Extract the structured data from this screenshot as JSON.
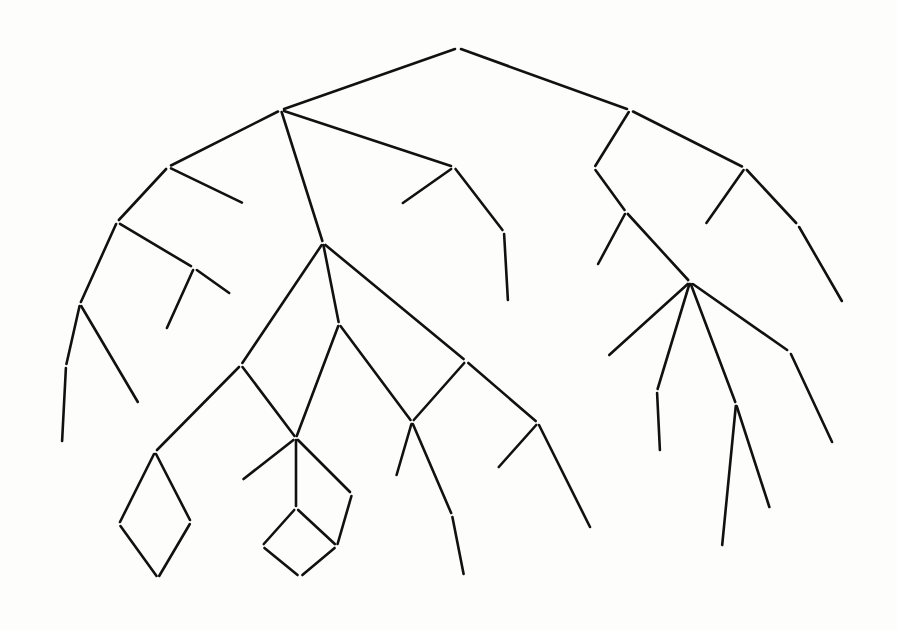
{
  "diagram": {
    "kind": "ontology-hierarchy",
    "ink_color": "#111111",
    "background_color": "#fdfdfc",
    "width": 897,
    "height": 630
  },
  "nodes": [
    {
      "id": "T",
      "label": "T",
      "x": 458,
      "y": 48,
      "root": true
    },
    {
      "id": "ENTITY",
      "label": "ENTITY",
      "x": 281,
      "y": 110
    },
    {
      "id": "SITUATION",
      "label": "SITUATION",
      "x": 630,
      "y": 110
    },
    {
      "id": "REPRESENTATION",
      "label": "REPRESENTATION",
      "x": 168,
      "y": 167
    },
    {
      "id": "ABSTRACTION",
      "label": "ABSTRACTION",
      "x": 454,
      "y": 167
    },
    {
      "id": "PROCESS",
      "label": "PROCESS",
      "x": 594,
      "y": 168
    },
    {
      "id": "STATE",
      "label": "STATE",
      "x": 745,
      "y": 168
    },
    {
      "id": "IMAGE",
      "label": "IMAGE",
      "x": 245,
      "y": 204
    },
    {
      "id": "JUSTICE",
      "label": "JUSTICE",
      "x": 400,
      "y": 205
    },
    {
      "id": "LEXICAL-DATA",
      "label": "LEXICAL-DATA",
      "x": 117,
      "y": 222
    },
    {
      "id": "EVENT",
      "label": "EVENT",
      "x": 626,
      "y": 212
    },
    {
      "id": "OWN",
      "label": "OWN",
      "x": 705,
      "y": 225
    },
    {
      "id": "BELIEVE",
      "label": "BELIEVE",
      "x": 798,
      "y": 225
    },
    {
      "id": "PROPOSITION",
      "label": "PROPOSITION",
      "x": 504,
      "y": 232
    },
    {
      "id": "PHYS-OBJECT",
      "label": "PHYS-OBJECT",
      "x": 323,
      "y": 243
    },
    {
      "id": "STRUCTURE",
      "label": "STRUCTURE",
      "x": 194,
      "y": 268
    },
    {
      "id": "STORM",
      "label": "STORM",
      "x": 597,
      "y": 266
    },
    {
      "id": "LIST",
      "label": "LIST",
      "x": 232,
      "y": 295
    },
    {
      "id": "ATOM",
      "label": "ATOM",
      "x": 80,
      "y": 304
    },
    {
      "id": "HYPOTHESIS",
      "label": "HYPOTHESIS",
      "x": 508,
      "y": 302
    },
    {
      "id": "KNOW",
      "label": "KNOW",
      "x": 843,
      "y": 303
    },
    {
      "id": "ACTION",
      "label": "ACTION",
      "x": 690,
      "y": 282
    },
    {
      "id": "MOBILE-ENTITY",
      "label": "MOBILE-ENTITY",
      "x": 339,
      "y": 324
    },
    {
      "id": "ARRAY",
      "label": "ARRAY",
      "x": 166,
      "y": 330
    },
    {
      "id": "NUMBER",
      "label": "NUMBER",
      "x": 66,
      "y": 366
    },
    {
      "id": "LIVING",
      "label": "LIVING",
      "x": 241,
      "y": 365
    },
    {
      "id": "NONLIVING",
      "label": "NONLIVING",
      "x": 466,
      "y": 361
    },
    {
      "id": "DRIVE",
      "label": "DRIVE",
      "x": 607,
      "y": 357
    },
    {
      "id": "JUMP",
      "label": "JUMP",
      "x": 790,
      "y": 352
    },
    {
      "id": "EAT",
      "label": "EAT",
      "x": 657,
      "y": 391
    },
    {
      "id": "WALK",
      "label": "WALK",
      "x": 736,
      "y": 404
    },
    {
      "id": "CHARACTER",
      "label": "CHARACTER",
      "x": 139,
      "y": 404
    },
    {
      "id": "VEHICLE",
      "label": "VEHICLE",
      "x": 412,
      "y": 422
    },
    {
      "id": "BUILDING",
      "label": "BUILDING",
      "x": 538,
      "y": 423
    },
    {
      "id": "ANIMAL",
      "label": "ANIMAL",
      "x": 296,
      "y": 438
    },
    {
      "id": "INTEGER",
      "label": "INTEGER",
      "x": 62,
      "y": 443
    },
    {
      "id": "LEAP",
      "label": "LEAP",
      "x": 833,
      "y": 444
    },
    {
      "id": "PLANT",
      "label": "PLANT",
      "x": 155,
      "y": 452
    },
    {
      "id": "DEVOUR",
      "label": "DEVOUR",
      "x": 660,
      "y": 452
    },
    {
      "id": "CAR",
      "label": "CAR",
      "x": 396,
      "y": 477
    },
    {
      "id": "FROG",
      "label": "FROG",
      "x": 241,
      "y": 481
    },
    {
      "id": "HOUSE",
      "label": "HOUSE",
      "x": 497,
      "y": 469
    },
    {
      "id": "DOG",
      "label": "DOG",
      "x": 296,
      "y": 508
    },
    {
      "id": "PET",
      "label": "PET",
      "x": 352,
      "y": 494
    },
    {
      "id": "STROLL",
      "label": "STROLL",
      "x": 770,
      "y": 509
    },
    {
      "id": "TRUCK",
      "label": "TRUCK",
      "x": 452,
      "y": 515
    },
    {
      "id": "TREE",
      "label": "TREE",
      "x": 119,
      "y": 524
    },
    {
      "id": "FERN",
      "label": "FERN",
      "x": 191,
      "y": 522
    },
    {
      "id": "BEAGLE",
      "label": "BEAGLE",
      "x": 262,
      "y": 546
    },
    {
      "id": "PET-DOG",
      "label": "PET-DOG",
      "x": 337,
      "y": 546
    },
    {
      "id": "SKYSCRAPER",
      "label": "SKYSCRAPER",
      "x": 591,
      "y": 529
    },
    {
      "id": "SAUNTER",
      "label": "SAUNTER",
      "x": 722,
      "y": 547
    },
    {
      "id": "TREE-FERN",
      "label": "TREE-FERN",
      "x": 158,
      "y": 578
    },
    {
      "id": "TRAILER-TRUCK",
      "label": "TRAILER-TRUCK",
      "x": 464,
      "y": 576
    },
    {
      "id": "PET-BEAGLE",
      "label": "PET-BEAGLE",
      "x": 300,
      "y": 577
    }
  ],
  "edges": [
    {
      "from": "T",
      "to": "ENTITY"
    },
    {
      "from": "T",
      "to": "SITUATION"
    },
    {
      "from": "ENTITY",
      "to": "REPRESENTATION"
    },
    {
      "from": "ENTITY",
      "to": "PHYS-OBJECT"
    },
    {
      "from": "ENTITY",
      "to": "ABSTRACTION"
    },
    {
      "from": "REPRESENTATION",
      "to": "LEXICAL-DATA"
    },
    {
      "from": "REPRESENTATION",
      "to": "IMAGE"
    },
    {
      "from": "LEXICAL-DATA",
      "to": "ATOM"
    },
    {
      "from": "LEXICAL-DATA",
      "to": "STRUCTURE"
    },
    {
      "from": "STRUCTURE",
      "to": "ARRAY"
    },
    {
      "from": "STRUCTURE",
      "to": "LIST"
    },
    {
      "from": "ATOM",
      "to": "NUMBER"
    },
    {
      "from": "ATOM",
      "to": "CHARACTER"
    },
    {
      "from": "NUMBER",
      "to": "INTEGER"
    },
    {
      "from": "ABSTRACTION",
      "to": "JUSTICE"
    },
    {
      "from": "ABSTRACTION",
      "to": "PROPOSITION"
    },
    {
      "from": "PROPOSITION",
      "to": "HYPOTHESIS"
    },
    {
      "from": "PHYS-OBJECT",
      "to": "LIVING"
    },
    {
      "from": "PHYS-OBJECT",
      "to": "MOBILE-ENTITY"
    },
    {
      "from": "PHYS-OBJECT",
      "to": "NONLIVING"
    },
    {
      "from": "LIVING",
      "to": "PLANT"
    },
    {
      "from": "LIVING",
      "to": "ANIMAL"
    },
    {
      "from": "MOBILE-ENTITY",
      "to": "ANIMAL"
    },
    {
      "from": "MOBILE-ENTITY",
      "to": "VEHICLE"
    },
    {
      "from": "PLANT",
      "to": "TREE"
    },
    {
      "from": "PLANT",
      "to": "FERN"
    },
    {
      "from": "TREE",
      "to": "TREE-FERN"
    },
    {
      "from": "FERN",
      "to": "TREE-FERN"
    },
    {
      "from": "ANIMAL",
      "to": "FROG"
    },
    {
      "from": "ANIMAL",
      "to": "DOG"
    },
    {
      "from": "ANIMAL",
      "to": "PET"
    },
    {
      "from": "DOG",
      "to": "BEAGLE"
    },
    {
      "from": "DOG",
      "to": "PET-DOG"
    },
    {
      "from": "PET",
      "to": "PET-DOG"
    },
    {
      "from": "BEAGLE",
      "to": "PET-BEAGLE"
    },
    {
      "from": "PET-DOG",
      "to": "PET-BEAGLE"
    },
    {
      "from": "NONLIVING",
      "to": "VEHICLE"
    },
    {
      "from": "NONLIVING",
      "to": "BUILDING"
    },
    {
      "from": "VEHICLE",
      "to": "CAR"
    },
    {
      "from": "VEHICLE",
      "to": "TRUCK"
    },
    {
      "from": "TRUCK",
      "to": "TRAILER-TRUCK"
    },
    {
      "from": "BUILDING",
      "to": "HOUSE"
    },
    {
      "from": "BUILDING",
      "to": "SKYSCRAPER"
    },
    {
      "from": "SITUATION",
      "to": "PROCESS"
    },
    {
      "from": "SITUATION",
      "to": "STATE"
    },
    {
      "from": "PROCESS",
      "to": "EVENT"
    },
    {
      "from": "EVENT",
      "to": "STORM"
    },
    {
      "from": "EVENT",
      "to": "ACTION"
    },
    {
      "from": "STATE",
      "to": "OWN"
    },
    {
      "from": "STATE",
      "to": "BELIEVE"
    },
    {
      "from": "BELIEVE",
      "to": "KNOW"
    },
    {
      "from": "ACTION",
      "to": "DRIVE"
    },
    {
      "from": "ACTION",
      "to": "EAT"
    },
    {
      "from": "ACTION",
      "to": "WALK"
    },
    {
      "from": "ACTION",
      "to": "JUMP"
    },
    {
      "from": "EAT",
      "to": "DEVOUR"
    },
    {
      "from": "WALK",
      "to": "SAUNTER"
    },
    {
      "from": "WALK",
      "to": "STROLL"
    },
    {
      "from": "JUMP",
      "to": "LEAP"
    }
  ]
}
